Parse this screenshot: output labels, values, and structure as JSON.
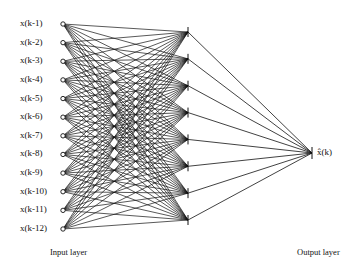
{
  "diagram": {
    "type": "neural-network",
    "input_layer": {
      "label": "Input layer",
      "nodes": [
        "x(k-1)",
        "x(k-2)",
        "x(k-3)",
        "x(k-4)",
        "x(k-5)",
        "x(k-6)",
        "x(k-7)",
        "x(k-8)",
        "x(k-9)",
        "x(k-10)",
        "x(k-11)",
        "x(k-12)"
      ]
    },
    "hidden_layer": {
      "node_count": 8
    },
    "output_layer": {
      "label": "Output layer",
      "node_label": "x̂(k)"
    },
    "colors": {
      "line": "#111111",
      "background": "#ffffff"
    }
  }
}
